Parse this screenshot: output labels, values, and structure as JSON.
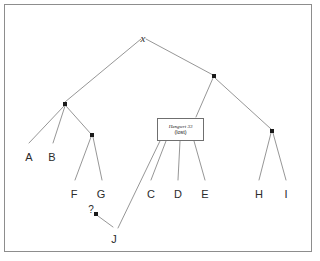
{
  "figure": {
    "background_color": "#ffffff",
    "frame_color": "#8d8d8d",
    "edge_color": "#8a8a8a",
    "node_color": "#1a1a1a",
    "text_color": "#2b2b2b"
  },
  "chart_data": {
    "type": "diagram",
    "subtype": "stemma-tree",
    "nodes": [
      {
        "id": "x",
        "label": "x",
        "kind": "root-archetype",
        "x": 143,
        "y": 33,
        "shape": "text-italic"
      },
      {
        "id": "n-left",
        "label": "",
        "kind": "internal",
        "x": 65,
        "y": 104,
        "shape": "dot"
      },
      {
        "id": "n-right",
        "label": "",
        "kind": "internal",
        "x": 214,
        "y": 76,
        "shape": "dot"
      },
      {
        "id": "n-fg",
        "label": "",
        "kind": "internal",
        "x": 92,
        "y": 135,
        "shape": "dot"
      },
      {
        "id": "n-hi",
        "label": "",
        "kind": "internal",
        "x": 272,
        "y": 131,
        "shape": "dot"
      },
      {
        "id": "hengwrt",
        "label": "Hengwrt 33",
        "kind": "lost-manuscript",
        "x": 180,
        "y": 129,
        "shape": "box",
        "sublabel": "(lost)"
      },
      {
        "id": "n-q",
        "label": "?",
        "kind": "uncertain",
        "x": 96,
        "y": 214,
        "shape": "dot"
      },
      {
        "id": "A",
        "label": "A",
        "kind": "leaf",
        "x": 29,
        "y": 152,
        "shape": "text"
      },
      {
        "id": "B",
        "label": "B",
        "kind": "leaf",
        "x": 52,
        "y": 152,
        "shape": "text"
      },
      {
        "id": "F",
        "label": "F",
        "kind": "leaf",
        "x": 74,
        "y": 189,
        "shape": "text"
      },
      {
        "id": "G",
        "label": "G",
        "kind": "leaf",
        "x": 101,
        "y": 189,
        "shape": "text"
      },
      {
        "id": "C",
        "label": "C",
        "kind": "leaf",
        "x": 151,
        "y": 189,
        "shape": "text"
      },
      {
        "id": "D",
        "label": "D",
        "kind": "leaf",
        "x": 178,
        "y": 189,
        "shape": "text"
      },
      {
        "id": "E",
        "label": "E",
        "kind": "leaf",
        "x": 205,
        "y": 189,
        "shape": "text"
      },
      {
        "id": "H",
        "label": "H",
        "kind": "leaf",
        "x": 259,
        "y": 189,
        "shape": "text"
      },
      {
        "id": "I",
        "label": "I",
        "kind": "leaf",
        "x": 286,
        "y": 189,
        "shape": "text"
      },
      {
        "id": "J",
        "label": "J",
        "kind": "leaf",
        "x": 114,
        "y": 234,
        "shape": "text"
      }
    ],
    "edges": [
      {
        "from": "x",
        "to": "n-left",
        "x1": 141,
        "y1": 39,
        "x2": 65,
        "y2": 102
      },
      {
        "from": "x",
        "to": "n-right",
        "x1": 146,
        "y1": 39,
        "x2": 213,
        "y2": 75
      },
      {
        "from": "n-left",
        "to": "A",
        "x1": 64,
        "y1": 106,
        "x2": 29,
        "y2": 143
      },
      {
        "from": "n-left",
        "to": "B",
        "x1": 65,
        "y1": 106,
        "x2": 53,
        "y2": 143
      },
      {
        "from": "n-left",
        "to": "n-fg",
        "x1": 66,
        "y1": 106,
        "x2": 91,
        "y2": 134
      },
      {
        "from": "n-fg",
        "to": "F",
        "x1": 91,
        "y1": 137,
        "x2": 75,
        "y2": 180
      },
      {
        "from": "n-fg",
        "to": "G",
        "x1": 93,
        "y1": 137,
        "x2": 102,
        "y2": 180
      },
      {
        "from": "n-right",
        "to": "hengwrt",
        "x1": 213,
        "y1": 78,
        "x2": 196,
        "y2": 117
      },
      {
        "from": "n-right",
        "to": "n-hi",
        "x1": 215,
        "y1": 78,
        "x2": 271,
        "y2": 129
      },
      {
        "from": "n-hi",
        "to": "H",
        "x1": 271,
        "y1": 133,
        "x2": 259,
        "y2": 180
      },
      {
        "from": "n-hi",
        "to": "I",
        "x1": 273,
        "y1": 133,
        "x2": 286,
        "y2": 180
      },
      {
        "from": "hengwrt",
        "to": "J",
        "x1": 160,
        "y1": 141,
        "x2": 118,
        "y2": 228
      },
      {
        "from": "hengwrt",
        "to": "C",
        "x1": 166,
        "y1": 141,
        "x2": 151,
        "y2": 180
      },
      {
        "from": "hengwrt",
        "to": "D",
        "x1": 180,
        "y1": 141,
        "x2": 178,
        "y2": 180
      },
      {
        "from": "hengwrt",
        "to": "E",
        "x1": 194,
        "y1": 141,
        "x2": 205,
        "y2": 180
      },
      {
        "from": "n-q",
        "to": "J",
        "x1": 98,
        "y1": 216,
        "x2": 113,
        "y2": 227
      }
    ],
    "query_marker": {
      "label": "?",
      "x": 91,
      "y": 205
    }
  }
}
